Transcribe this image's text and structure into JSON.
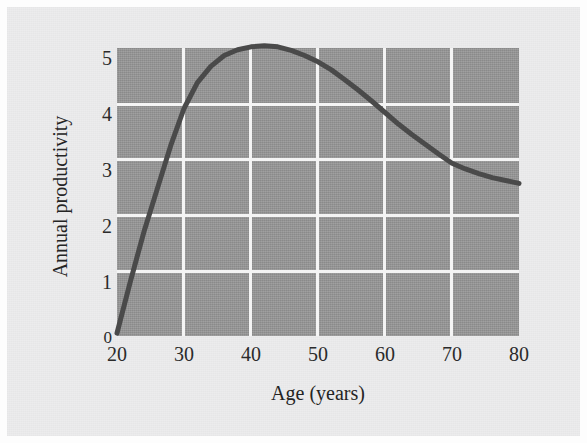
{
  "figure": {
    "background_color": "#ececed",
    "plot_background_color": "#979797",
    "grid_color": "#f4f4f4",
    "curve_color": "#4a4a4a"
  },
  "chart_data": {
    "type": "line",
    "title": "",
    "xlabel": "Age (years)",
    "ylabel": "Annual productivity",
    "xlim": [
      20,
      80
    ],
    "ylim": [
      0,
      5
    ],
    "xticks": [
      "20",
      "30",
      "40",
      "50",
      "60",
      "70",
      "80"
    ],
    "yticks": [
      "0",
      "1",
      "2",
      "3",
      "4",
      "5"
    ],
    "grid": true,
    "legend": "none",
    "series": [
      {
        "name": "Annual productivity",
        "x": [
          20,
          22,
          24,
          26,
          28,
          30,
          32,
          34,
          36,
          38,
          40,
          42,
          44,
          46,
          48,
          50,
          52,
          54,
          56,
          58,
          60,
          62,
          64,
          66,
          68,
          70,
          72,
          74,
          76,
          78,
          80
        ],
        "values": [
          0.05,
          0.95,
          1.8,
          2.55,
          3.3,
          3.95,
          4.4,
          4.68,
          4.87,
          4.97,
          5.02,
          5.04,
          5.02,
          4.96,
          4.87,
          4.76,
          4.62,
          4.45,
          4.27,
          4.08,
          3.88,
          3.68,
          3.5,
          3.33,
          3.16,
          3.0,
          2.9,
          2.82,
          2.75,
          2.7,
          2.65
        ]
      }
    ],
    "annotations": []
  }
}
